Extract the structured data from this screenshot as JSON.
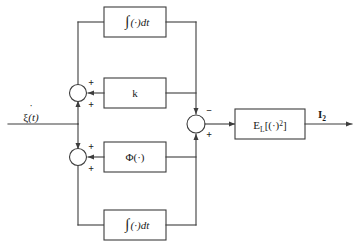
{
  "diagram": {
    "type": "signal-flow-block-diagram",
    "stroke_color": "#3d3d3d",
    "text_color": "#1a1a1a",
    "background": "#ffffff",
    "input": {
      "label_base": "ξ",
      "label_dot": "˙",
      "label_arg": "(t)",
      "name": "xi-dot-of-t"
    },
    "output": {
      "label_base": "I",
      "label_sub": "2",
      "name": "I-subscript-2"
    },
    "blocks": [
      {
        "id": "integrator-top",
        "label": "∫ (·)dt",
        "integral": "∫",
        "body": "(·)dt"
      },
      {
        "id": "gain-k",
        "label": "k",
        "integral": "",
        "body": "k"
      },
      {
        "id": "phi",
        "label": "Φ(·)",
        "integral": "",
        "body": "Φ(·)"
      },
      {
        "id": "integrator-bottom",
        "label": "∫ (·)dt",
        "integral": "∫",
        "body": "(·)dt"
      },
      {
        "id": "expectation",
        "label": "E_L[(·)^2]",
        "integral": "",
        "body": "E"
      }
    ],
    "expectation_block": {
      "base": "E",
      "subscript": "L",
      "bracket_open": "[(·)",
      "superscript": "2",
      "bracket_close": "]"
    },
    "summers": [
      {
        "id": "summer-upper-left",
        "signs": [
          "+",
          "+"
        ]
      },
      {
        "id": "summer-lower-left",
        "signs": [
          "+",
          "+"
        ]
      },
      {
        "id": "summer-right",
        "signs": [
          "−",
          "+"
        ]
      }
    ],
    "signs": {
      "plus": "+",
      "minus": "−"
    }
  }
}
